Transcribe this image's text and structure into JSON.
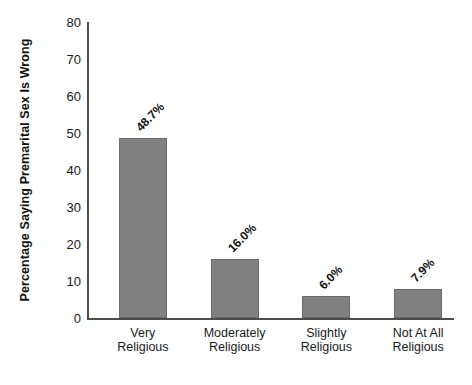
{
  "chart_data": {
    "type": "bar",
    "title": "",
    "subtitle": "",
    "xlabel": "",
    "ylabel": "Percentage Saying Premarital Sex Is Wrong",
    "ylim": [
      0,
      80
    ],
    "yticks": [
      0,
      10,
      20,
      30,
      40,
      50,
      60,
      70,
      80
    ],
    "ytick_labels": [
      "0",
      "10",
      "20",
      "30",
      "40",
      "50",
      "60",
      "70",
      "80"
    ],
    "grid": false,
    "legend": false,
    "legend_position": "none",
    "bar_color": "#808080",
    "bar_edge_color": "#6b6b6b",
    "axis_color": "#4d4d4d",
    "categories": [
      "Very Religious",
      "Moderately Religious",
      "Slightly Religious",
      "Not At All Religious"
    ],
    "category_lines": [
      [
        "Very",
        "Religious"
      ],
      [
        "Moderately",
        "Religious"
      ],
      [
        "Slightly",
        "Religious"
      ],
      [
        "Not At All",
        "Religious"
      ]
    ],
    "values": [
      48.7,
      16.0,
      6.0,
      7.9
    ],
    "data_labels": [
      "48.7%",
      "16.0%",
      "6.0%",
      "7.9%"
    ],
    "data_label_rotation_deg": 45
  }
}
